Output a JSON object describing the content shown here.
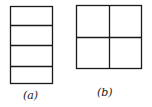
{
  "figures": [
    {
      "id": "a",
      "label": "(a)",
      "description": "rectangle divided into 4 horizontal strips"
    },
    {
      "id": "b",
      "label": "(b)",
      "description": "square divided into 2x2 grid"
    }
  ],
  "colors": {
    "stroke": "#1a1a1a",
    "background": "#ffffff"
  }
}
